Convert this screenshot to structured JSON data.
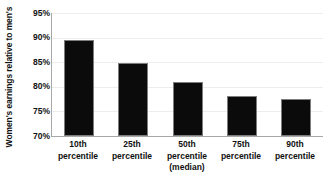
{
  "chart_data": {
    "type": "bar",
    "title": "",
    "xlabel": "",
    "ylabel": "Women's earnings relative to men's",
    "categories": [
      "10th percentile",
      "25th percentile",
      "50th percentile (median)",
      "75th percentile",
      "90th percentile"
    ],
    "category_lines": [
      [
        "10th",
        "percentile"
      ],
      [
        "25th",
        "percentile"
      ],
      [
        "50th",
        "percentile",
        "(median)"
      ],
      [
        "75th",
        "percentile"
      ],
      [
        "90th",
        "percentile"
      ]
    ],
    "values": [
      89.6,
      84.9,
      81.0,
      78.1,
      77.6
    ],
    "value_labels": [
      "89.6%",
      "84.9%",
      "81.0%",
      "78.1%",
      "77.6%"
    ],
    "ylim": [
      70,
      95
    ],
    "ytick_labels": [
      "95%",
      "90%",
      "85%",
      "80%",
      "75%",
      "70%"
    ],
    "ytick_values": [
      95,
      90,
      85,
      80,
      75,
      70
    ],
    "grid": true,
    "legend": false,
    "bar_color": "#0b0b0b",
    "bar_border_color": "#7d7d7d",
    "gridline_color": "#ededed",
    "axis_color": "#a8a8a8",
    "text_color": "#111111",
    "background_color": "#ffffff"
  }
}
